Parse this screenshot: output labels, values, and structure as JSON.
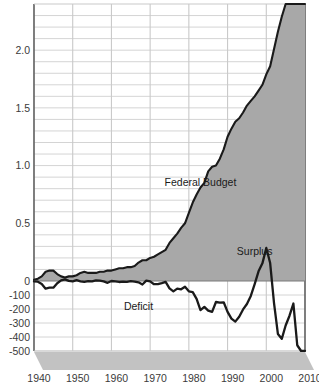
{
  "chart_data": {
    "type": "area",
    "title": "",
    "subtitle": "",
    "xlabel": "",
    "ylabel": "",
    "grid": true,
    "legend_position": "inline-annotations",
    "xlim": [
      1940,
      2010
    ],
    "x_ticks": [
      "1940",
      "1950",
      "1960",
      "1970",
      "1980",
      "1990",
      "2000",
      "2010"
    ],
    "x_tick_values": [
      1940,
      1950,
      1960,
      1970,
      1980,
      1990,
      2000,
      2010
    ],
    "y_upper_label": "Federal Budget (trillions of dollars)",
    "y_upper_ticks": [
      "2.0",
      "1.5",
      "1.0",
      "0.5",
      "0"
    ],
    "y_upper_tick_values": [
      2.0,
      1.5,
      1.0,
      0.5,
      0
    ],
    "y_upper_lim": [
      0,
      2.4
    ],
    "y_upper_minor_step": 0.1,
    "y_lower_label": "Surplus / Deficit (billions of dollars)",
    "y_lower_ticks": [
      "-100",
      "-200",
      "-300",
      "-400",
      "-500"
    ],
    "y_lower_tick_values": [
      -100,
      -200,
      -300,
      -400,
      -500
    ],
    "y_lower_lim": [
      -500,
      0
    ],
    "annotations": [
      {
        "name": "federal-budget-label",
        "text": "Federal Budget",
        "x": 1983,
        "y_px": 186
      },
      {
        "name": "surplus-label",
        "text": "Surplus",
        "x": 1997,
        "y_px": 255
      },
      {
        "name": "deficit-label",
        "text": "Deficit",
        "x": 1967,
        "y_px": 310
      }
    ],
    "series": [
      {
        "name": "Federal Budget",
        "type": "area",
        "units": "trillions of dollars",
        "fill_color": "#a8a8a8",
        "line_color": "#1a1a1a",
        "x": [
          1940,
          1941,
          1942,
          1943,
          1944,
          1945,
          1946,
          1947,
          1948,
          1949,
          1950,
          1951,
          1952,
          1953,
          1954,
          1955,
          1956,
          1957,
          1958,
          1959,
          1960,
          1961,
          1962,
          1963,
          1964,
          1965,
          1966,
          1967,
          1968,
          1969,
          1970,
          1971,
          1972,
          1973,
          1974,
          1975,
          1976,
          1977,
          1978,
          1979,
          1980,
          1981,
          1982,
          1983,
          1984,
          1985,
          1986,
          1987,
          1988,
          1989,
          1990,
          1991,
          1992,
          1993,
          1994,
          1995,
          1996,
          1997,
          1998,
          1999,
          2000,
          2001,
          2002,
          2003,
          2004,
          2005,
          2006,
          2007,
          2008,
          2009,
          2010
        ],
        "values": [
          0.01,
          0.02,
          0.04,
          0.08,
          0.09,
          0.09,
          0.06,
          0.04,
          0.03,
          0.04,
          0.04,
          0.05,
          0.07,
          0.08,
          0.07,
          0.07,
          0.07,
          0.08,
          0.08,
          0.09,
          0.09,
          0.1,
          0.11,
          0.11,
          0.12,
          0.12,
          0.13,
          0.16,
          0.18,
          0.18,
          0.2,
          0.21,
          0.23,
          0.25,
          0.27,
          0.33,
          0.37,
          0.41,
          0.46,
          0.5,
          0.59,
          0.68,
          0.75,
          0.81,
          0.85,
          0.95,
          0.99,
          1.0,
          1.06,
          1.14,
          1.25,
          1.32,
          1.38,
          1.41,
          1.46,
          1.52,
          1.56,
          1.6,
          1.65,
          1.7,
          1.79,
          1.86,
          2.01,
          2.16,
          2.29,
          2.47,
          2.66,
          2.73,
          2.98,
          3.52,
          3.46
        ]
      },
      {
        "name": "Surplus / Deficit",
        "type": "line",
        "units": "billions of dollars",
        "line_color": "#1a1a1a",
        "x": [
          1940,
          1941,
          1942,
          1943,
          1944,
          1945,
          1946,
          1947,
          1948,
          1949,
          1950,
          1951,
          1952,
          1953,
          1954,
          1955,
          1956,
          1957,
          1958,
          1959,
          1960,
          1961,
          1962,
          1963,
          1964,
          1965,
          1966,
          1967,
          1968,
          1969,
          1970,
          1971,
          1972,
          1973,
          1974,
          1975,
          1976,
          1977,
          1978,
          1979,
          1980,
          1981,
          1982,
          1983,
          1984,
          1985,
          1986,
          1987,
          1988,
          1989,
          1990,
          1991,
          1992,
          1993,
          1994,
          1995,
          1996,
          1997,
          1998,
          1999,
          2000,
          2001,
          2002,
          2003,
          2004,
          2005,
          2006,
          2007,
          2008,
          2009,
          2010
        ],
        "values": [
          -3,
          -5,
          -21,
          -55,
          -48,
          -48,
          -16,
          4,
          12,
          1,
          -3,
          6,
          -2,
          -6,
          -1,
          -3,
          4,
          3,
          -3,
          -13,
          0,
          -3,
          -7,
          -5,
          -6,
          -1,
          -4,
          -9,
          -25,
          3,
          -3,
          -23,
          -23,
          -15,
          -6,
          -53,
          -74,
          -54,
          -59,
          -41,
          -74,
          -79,
          -128,
          -208,
          -185,
          -212,
          -221,
          -150,
          -155,
          -152,
          -221,
          -269,
          -290,
          -255,
          -203,
          -164,
          -107,
          -22,
          69,
          126,
          236,
          128,
          -158,
          -378,
          -413,
          -318,
          -248,
          -161,
          -459,
          -1413,
          -1294
        ]
      }
    ]
  },
  "axes": {
    "y_left_labels": [
      "2.0",
      "1.5",
      "1.0",
      "0.5",
      "0",
      "-100",
      "-200",
      "-300",
      "-400",
      "-500"
    ],
    "x_bottom_labels": [
      "1940",
      "1950",
      "1960",
      "1970",
      "1980",
      "1990",
      "2000",
      "2010"
    ]
  },
  "colors": {
    "area_fill": "#a8a8a8",
    "curve_line": "#1a1a1a",
    "gridline": "#c9c9c9",
    "axis_line": "#555555",
    "base_platform": "#c2c2c2",
    "background": "#ffffff",
    "tick_text": "#3b3b3b"
  }
}
